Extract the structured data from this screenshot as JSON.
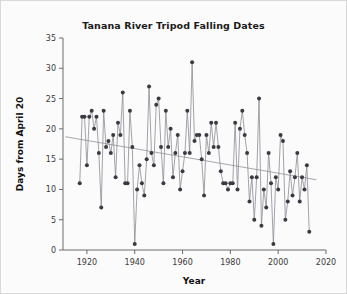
{
  "chart_data": {
    "type": "line",
    "title": "Tanana River Tripod Falling Dates",
    "xlabel": "Year",
    "ylabel": "Days from April 20",
    "xlim": [
      1910,
      2020
    ],
    "ylim": [
      0,
      35
    ],
    "xticks": [
      1920,
      1940,
      1960,
      1980,
      2000,
      2020
    ],
    "yticks": [
      0,
      5,
      10,
      15,
      20,
      25,
      30,
      35
    ],
    "grid": false,
    "legend": null,
    "marker": "filled-circle",
    "marker_color": "#3a3a42",
    "line_color": "#8c8c94",
    "trend_color": "#a9a9b0",
    "trendline": {
      "x": [
        1911,
        2016
      ],
      "y": [
        18.7,
        11.6
      ]
    },
    "x": [
      1917,
      1918,
      1919,
      1920,
      1921,
      1922,
      1923,
      1924,
      1925,
      1926,
      1927,
      1928,
      1929,
      1930,
      1931,
      1932,
      1933,
      1934,
      1935,
      1936,
      1937,
      1938,
      1939,
      1940,
      1941,
      1942,
      1943,
      1944,
      1945,
      1946,
      1947,
      1948,
      1949,
      1950,
      1951,
      1952,
      1953,
      1954,
      1955,
      1956,
      1957,
      1958,
      1959,
      1960,
      1961,
      1962,
      1963,
      1964,
      1965,
      1966,
      1967,
      1968,
      1969,
      1970,
      1971,
      1972,
      1973,
      1974,
      1975,
      1976,
      1977,
      1978,
      1979,
      1980,
      1981,
      1982,
      1983,
      1984,
      1985,
      1986,
      1987,
      1988,
      1989,
      1990,
      1991,
      1992,
      1993,
      1994,
      1995,
      1996,
      1997,
      1998,
      1999,
      2000,
      2001,
      2002,
      2003,
      2004,
      2005,
      2006,
      2007,
      2008,
      2009,
      2010,
      2011,
      2012,
      2013
    ],
    "y": [
      11,
      22,
      22,
      14,
      22,
      23,
      20,
      22,
      16,
      7,
      23,
      17,
      18,
      16,
      19,
      12,
      21,
      19,
      26,
      11,
      11,
      23,
      17,
      1,
      10,
      14,
      11,
      9,
      15,
      27,
      16,
      14,
      24,
      25,
      17,
      11,
      23,
      17,
      20,
      12,
      16,
      19,
      10,
      13,
      16,
      23,
      16,
      31,
      18,
      19,
      19,
      15,
      9,
      19,
      16,
      21,
      17,
      21,
      17,
      13,
      11,
      11,
      10,
      11,
      11,
      21,
      10,
      20,
      23,
      19,
      16,
      8,
      12,
      5,
      12,
      25,
      4,
      10,
      7,
      16,
      11,
      1,
      12,
      10,
      19,
      18,
      5,
      8,
      13,
      9,
      12,
      16,
      8,
      12,
      10,
      14,
      3,
      31
    ]
  }
}
